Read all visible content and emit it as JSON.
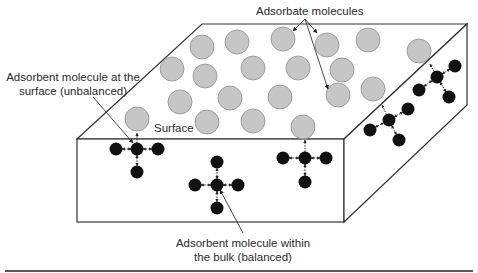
{
  "labels": {
    "adsorbate": "Adsorbate molecules",
    "surface_molecule": [
      "Adsorbent molecule at the",
      "surface (unbalanced)"
    ],
    "surface": "Surface",
    "bulk_molecule": [
      "Adsorbent molecule within",
      "the bulk (balanced)"
    ]
  },
  "colors": {
    "adsorbate_fill": "#c6c6c6",
    "adsorbate_stroke": "#8f8f8f",
    "adsorbent_fill": "#111111",
    "edge": "#333333",
    "text": "#2a2a2a"
  },
  "adsorbate_molecules": [
    [
      202,
      47
    ],
    [
      237,
      42
    ],
    [
      283,
      39
    ],
    [
      327,
      45
    ],
    [
      368,
      40
    ],
    [
      172,
      69
    ],
    [
      205,
      76
    ],
    [
      253,
      68
    ],
    [
      298,
      68
    ],
    [
      342,
      70
    ],
    [
      419,
      51
    ],
    [
      180,
      102
    ],
    [
      230,
      98
    ],
    [
      280,
      97
    ],
    [
      373,
      89
    ],
    [
      338,
      95
    ],
    [
      137,
      119
    ],
    [
      207,
      122
    ],
    [
      253,
      121
    ],
    [
      303,
      127
    ]
  ],
  "adsorbent_molecules": [
    {
      "name": "surface-molecule-front-left",
      "cx": 137,
      "cy": 149,
      "arms": [
        [
          116,
          149
        ],
        [
          158,
          149
        ],
        [
          137,
          172
        ]
      ],
      "up_to": [
        137,
        133
      ]
    },
    {
      "name": "bulk-molecule",
      "cx": 217,
      "cy": 185,
      "arms": [
        [
          217,
          162
        ],
        [
          195,
          185
        ],
        [
          238,
          185
        ],
        [
          217,
          208
        ]
      ],
      "up_to": null
    },
    {
      "name": "surface-molecule-front-right",
      "cx": 305,
      "cy": 158,
      "arms": [
        [
          283,
          158
        ],
        [
          326,
          158
        ],
        [
          305,
          182
        ]
      ],
      "up_to": [
        305,
        140
      ]
    },
    {
      "name": "surface-molecule-side-lower",
      "cx": 389,
      "cy": 120,
      "arms": [
        [
          408,
          109
        ],
        [
          370,
          130
        ],
        [
          399,
          140
        ]
      ],
      "up_to": [
        382,
        105
      ]
    },
    {
      "name": "surface-molecule-side-upper",
      "cx": 437,
      "cy": 77,
      "arms": [
        [
          455,
          66
        ],
        [
          419,
          90
        ],
        [
          449,
          97
        ]
      ],
      "up_to": [
        430,
        64
      ]
    }
  ]
}
